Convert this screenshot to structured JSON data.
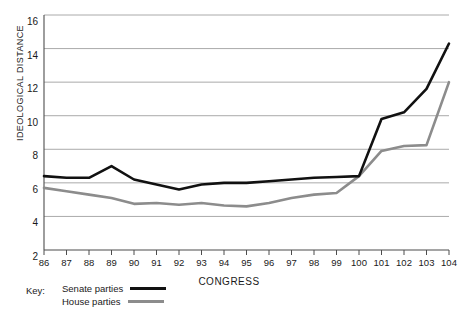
{
  "chart_data": {
    "type": "line",
    "title": "",
    "xlabel": "CONGRESS",
    "ylabel": "IDEOLOGICAL DISTANCE",
    "x": [
      86,
      87,
      88,
      89,
      90,
      91,
      92,
      93,
      94,
      95,
      96,
      97,
      98,
      99,
      100,
      101,
      102,
      103,
      104
    ],
    "xtick_labels": [
      "86",
      "87",
      "88",
      "89",
      "90",
      "91",
      "92",
      "93",
      "94",
      "95",
      "96",
      "97",
      "98",
      "99",
      "100",
      "101",
      "102",
      "103",
      "104"
    ],
    "ytick_labels": [
      "2",
      "4",
      "6",
      "8",
      "10",
      "12",
      "14",
      "16"
    ],
    "yticks": [
      2,
      4,
      6,
      8,
      10,
      12,
      14,
      16
    ],
    "ylim": [
      2,
      16
    ],
    "xlim": [
      86,
      104
    ],
    "grid": true,
    "legend_position": "bottom-left",
    "series": [
      {
        "name": "Senate parties",
        "color": "#111111",
        "width": 2.6,
        "values": [
          6.4,
          6.3,
          6.3,
          7.0,
          6.2,
          5.9,
          5.6,
          5.9,
          6.0,
          6.0,
          6.1,
          6.2,
          6.3,
          6.35,
          6.4,
          9.8,
          10.2,
          11.6,
          14.3
        ]
      },
      {
        "name": "House parties",
        "color": "#8c8c8c",
        "width": 2.6,
        "values": [
          5.7,
          5.5,
          5.3,
          5.1,
          4.75,
          4.8,
          4.7,
          4.8,
          4.65,
          4.6,
          4.8,
          5.1,
          5.3,
          5.4,
          6.4,
          7.9,
          8.2,
          8.25,
          12.0
        ]
      }
    ]
  },
  "legend": {
    "key_label": "Key:",
    "entries": [
      {
        "label": "Senate parties",
        "swatch": "senate"
      },
      {
        "label": "House parties",
        "swatch": "house"
      }
    ]
  },
  "axes": {
    "y_title": "IDEOLOGICAL DISTANCE",
    "x_title": "CONGRESS"
  },
  "colors": {
    "senate_line": "#111111",
    "house_line": "#8c8c8c",
    "grid": "#a0a0a0",
    "axis": "#4d4d4d",
    "text": "#1a1a1a",
    "background": "#ffffff"
  }
}
